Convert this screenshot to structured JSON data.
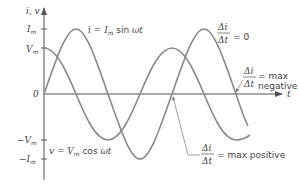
{
  "axes": {
    "y_label": "i, v",
    "x_label": "t",
    "origin_label": "0",
    "y_ticks": {
      "im": {
        "main": "I",
        "sub": "m"
      },
      "vm": {
        "main": "V",
        "sub": "m"
      },
      "neg_vm": {
        "main": "−V",
        "sub": "m"
      },
      "neg_im": {
        "main": "−I",
        "sub": "m"
      }
    }
  },
  "curves": {
    "current": {
      "lhs": "i = I",
      "sub": "m",
      "fn": " sin ",
      "arg": "ωt"
    },
    "voltage": {
      "lhs": "v = V",
      "sub": "m",
      "fn": " cos ",
      "arg": "ωt"
    }
  },
  "annotations": {
    "zero_slope": {
      "num": "Δi",
      "den": "Δt",
      "rhs": "= 0"
    },
    "max_negative": {
      "num": "Δi",
      "den": "Δt",
      "rhs": "= max",
      "rhs2": "negative"
    },
    "max_positive": {
      "num": "Δi",
      "den": "Δt",
      "rhs": "= max positive"
    }
  },
  "colors": {
    "curve": "#8a8a8a",
    "axis": "#555555",
    "text": "#444444"
  }
}
